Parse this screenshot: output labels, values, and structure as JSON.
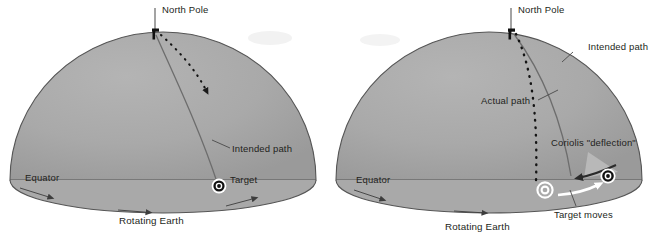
{
  "figure": {
    "background_color": "#ffffff",
    "dome_color": "#a9a9a9",
    "dome_edge_color": "#4a4a4a",
    "ink_color": "#231f20"
  },
  "panels": [
    {
      "id": "left",
      "name": "non-rotating-reference-view",
      "labels": {
        "north_pole": "North Pole",
        "intended_path": "Intended path",
        "target": "Target",
        "equator": "Equator",
        "rotating_earth": "Rotating Earth"
      },
      "elements": {
        "launcher_icon": "cannon-figure-icon",
        "target_icon": "bullseye-icon",
        "projectile_path_style": "dotted-with-arrowhead",
        "intended_path_style": "solid-line",
        "equator_arrow_icon": "rotation-arrowhead-icon",
        "equator_arrow_count": 2
      }
    },
    {
      "id": "right",
      "name": "rotating-reference-view",
      "labels": {
        "north_pole": "North Pole",
        "intended_path": "Intended path",
        "actual_path": "Actual path",
        "coriolis_deflection": "Coriolis \"deflection\"",
        "target_moves": "Target moves",
        "equator": "Equator",
        "rotating_earth": "Rotating Earth"
      },
      "elements": {
        "launcher_icon": "cannon-figure-icon",
        "target_icon_original": "bullseye-ghost-icon",
        "target_icon_moved": "bullseye-icon",
        "deflection_arrow_icon": "left-arrow-icon",
        "target_move_arrow_icon": "right-arrow-white-icon",
        "actual_path_style": "dotted-line",
        "intended_path_style": "solid-line",
        "equator_arrow_icon": "rotation-arrowhead-icon",
        "equator_arrow_count": 2
      }
    }
  ]
}
